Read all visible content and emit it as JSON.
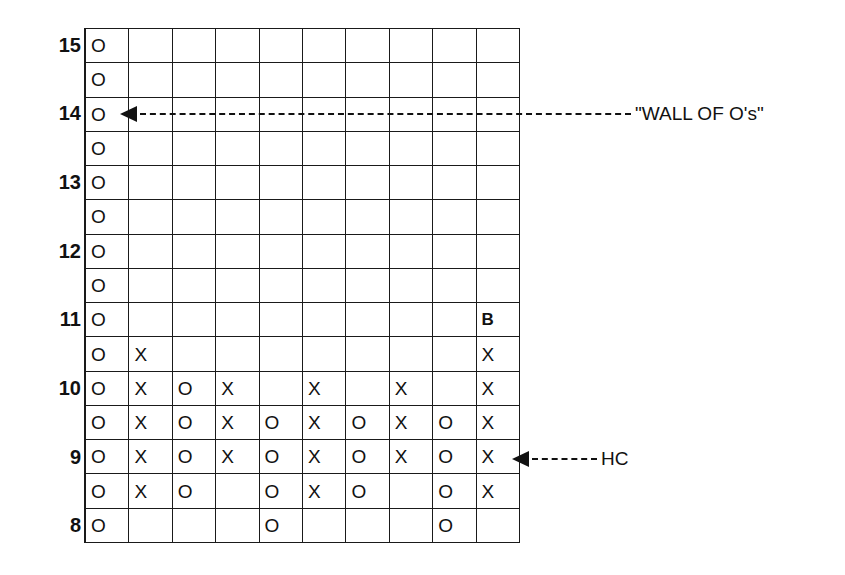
{
  "chart_data": {
    "type": "point-and-figure",
    "title": "",
    "xlabel": "",
    "ylabel": "",
    "box_size": 0.5,
    "ylim": [
      8,
      15
    ],
    "row_prices": [
      15,
      14.5,
      14,
      13.5,
      13,
      12.5,
      12,
      11.5,
      11,
      10.5,
      10,
      9.5,
      9,
      8.5,
      8
    ],
    "row_labels": [
      "15",
      "",
      "14",
      "",
      "13",
      "",
      "12",
      "",
      "11",
      "",
      "10",
      "",
      "9",
      "",
      "8"
    ],
    "columns": [
      {
        "index": 1,
        "type": "O",
        "from": 15,
        "to": 8
      },
      {
        "index": 2,
        "type": "X",
        "from": 8.5,
        "to": 10.5
      },
      {
        "index": 3,
        "type": "O",
        "from": 10,
        "to": 8.5
      },
      {
        "index": 4,
        "type": "X",
        "from": 9,
        "to": 10
      },
      {
        "index": 5,
        "type": "O",
        "from": 9.5,
        "to": 8
      },
      {
        "index": 6,
        "type": "X",
        "from": 8.5,
        "to": 10
      },
      {
        "index": 7,
        "type": "O",
        "from": 9.5,
        "to": 8.5
      },
      {
        "index": 8,
        "type": "X",
        "from": 9,
        "to": 10
      },
      {
        "index": 9,
        "type": "O",
        "from": 9.5,
        "to": 8
      },
      {
        "index": 10,
        "type": "X",
        "from": 8.5,
        "to": 10.5,
        "signal": {
          "price": 11,
          "mark": "B"
        }
      }
    ],
    "grid": [
      [
        "O",
        "",
        "",
        "",
        "",
        "",
        "",
        "",
        "",
        ""
      ],
      [
        "O",
        "",
        "",
        "",
        "",
        "",
        "",
        "",
        "",
        ""
      ],
      [
        "O",
        "",
        "",
        "",
        "",
        "",
        "",
        "",
        "",
        ""
      ],
      [
        "O",
        "",
        "",
        "",
        "",
        "",
        "",
        "",
        "",
        ""
      ],
      [
        "O",
        "",
        "",
        "",
        "",
        "",
        "",
        "",
        "",
        ""
      ],
      [
        "O",
        "",
        "",
        "",
        "",
        "",
        "",
        "",
        "",
        ""
      ],
      [
        "O",
        "",
        "",
        "",
        "",
        "",
        "",
        "",
        "",
        ""
      ],
      [
        "O",
        "",
        "",
        "",
        "",
        "",
        "",
        "",
        "",
        ""
      ],
      [
        "O",
        "",
        "",
        "",
        "",
        "",
        "",
        "",
        "",
        "B"
      ],
      [
        "O",
        "X",
        "",
        "",
        "",
        "",
        "",
        "",
        "",
        "X"
      ],
      [
        "O",
        "X",
        "O",
        "X",
        "",
        "X",
        "",
        "X",
        "",
        "X"
      ],
      [
        "O",
        "X",
        "O",
        "X",
        "O",
        "X",
        "O",
        "X",
        "O",
        "X"
      ],
      [
        "O",
        "X",
        "O",
        "X",
        "O",
        "X",
        "O",
        "X",
        "O",
        "X"
      ],
      [
        "O",
        "X",
        "O",
        "",
        "O",
        "X",
        "O",
        "",
        "O",
        "X"
      ],
      [
        "O",
        "",
        "",
        "",
        "O",
        "",
        "",
        "",
        "O",
        ""
      ]
    ],
    "annotations": [
      {
        "text": "\"WALL OF O's\"",
        "points_to": {
          "column": 1,
          "price": 14
        }
      },
      {
        "text": "HC",
        "points_to": {
          "column": 10,
          "price": 9
        }
      }
    ],
    "grid_lines": true,
    "legend": null
  }
}
